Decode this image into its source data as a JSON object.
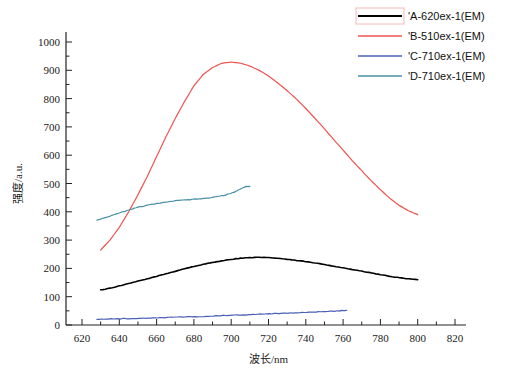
{
  "chart_data": {
    "type": "line",
    "title": "",
    "xlabel": "波长/nm",
    "ylabel": "强度/a.u.",
    "xlim": [
      620,
      820
    ],
    "ylim": [
      0,
      1000
    ],
    "xticks": [
      620,
      640,
      660,
      680,
      700,
      720,
      740,
      760,
      780,
      800,
      820
    ],
    "yticks": [
      0,
      100,
      200,
      300,
      400,
      500,
      600,
      700,
      800,
      900,
      1000
    ],
    "xtick_labels": [
      "620",
      "640",
      "660",
      "680",
      "700",
      "720",
      "740",
      "760",
      "780",
      "800",
      "820"
    ],
    "ytick_labels": [
      "0",
      "100",
      "200",
      "300",
      "400",
      "500",
      "600",
      "700",
      "800",
      "900",
      "1000"
    ],
    "minor_tick_step_x": 10,
    "minor_tick_step_y": 50,
    "grid": false,
    "legend_position": "top-right",
    "series": [
      {
        "name": "'A-620ex-1(EM)",
        "color": "#000000",
        "x": [
          630,
          635,
          640,
          645,
          650,
          655,
          660,
          665,
          670,
          675,
          680,
          685,
          690,
          695,
          700,
          705,
          710,
          715,
          720,
          725,
          730,
          735,
          740,
          745,
          750,
          755,
          760,
          765,
          770,
          775,
          780,
          785,
          790,
          795,
          800
        ],
        "y": [
          124,
          130,
          138,
          146,
          155,
          163,
          172,
          181,
          190,
          199,
          207,
          214,
          221,
          227,
          232,
          236,
          238,
          239,
          238,
          236,
          232,
          228,
          224,
          219,
          214,
          208,
          202,
          196,
          190,
          184,
          178,
          172,
          167,
          163,
          160
        ]
      },
      {
        "name": "'B-510ex-1(EM)",
        "color": "#ef5350",
        "x": [
          630,
          635,
          640,
          645,
          650,
          655,
          660,
          665,
          670,
          675,
          680,
          685,
          690,
          695,
          700,
          705,
          710,
          715,
          720,
          725,
          730,
          735,
          740,
          745,
          750,
          755,
          760,
          765,
          770,
          775,
          780,
          785,
          790,
          795,
          800
        ],
        "y": [
          265,
          300,
          345,
          400,
          460,
          525,
          595,
          665,
          730,
          790,
          845,
          885,
          910,
          925,
          929,
          925,
          915,
          900,
          880,
          855,
          828,
          798,
          765,
          730,
          693,
          655,
          618,
          580,
          545,
          510,
          478,
          448,
          423,
          404,
          390
        ]
      },
      {
        "name": "'C-710ex-1(EM)",
        "color": "#4a5fb5",
        "x": [
          628,
          633,
          638,
          643,
          648,
          653,
          658,
          663,
          668,
          673,
          678,
          683,
          688,
          693,
          698,
          703,
          708,
          713,
          718,
          723,
          728,
          733,
          738,
          743,
          748,
          753,
          758,
          762
        ],
        "y": [
          20,
          21,
          22,
          22,
          23,
          24,
          25,
          26,
          27,
          28,
          29,
          30,
          31,
          33,
          34,
          35,
          36,
          38,
          39,
          40,
          41,
          43,
          44,
          45,
          47,
          48,
          50,
          52
        ]
      },
      {
        "name": "'D-710ex-1(EM)",
        "color": "#4a90a4",
        "x": [
          628,
          632,
          636,
          640,
          644,
          648,
          652,
          656,
          660,
          664,
          668,
          672,
          676,
          680,
          684,
          688,
          692,
          696,
          700,
          703,
          706,
          708,
          710
        ],
        "y": [
          370,
          378,
          387,
          395,
          404,
          412,
          419,
          424,
          429,
          433,
          437,
          440,
          442,
          444,
          446,
          449,
          453,
          458,
          465,
          474,
          484,
          489,
          490
        ]
      }
    ]
  },
  "legend": {
    "items": [
      {
        "label": "'A-620ex-1(EM)",
        "color": "#000000",
        "boxed": true
      },
      {
        "label": "'B-510ex-1(EM)",
        "color": "#ef5350",
        "boxed": false
      },
      {
        "label": "'C-710ex-1(EM)",
        "color": "#4a5fb5",
        "boxed": false
      },
      {
        "label": "'D-710ex-1(EM)",
        "color": "#4a90a4",
        "boxed": false
      }
    ]
  }
}
